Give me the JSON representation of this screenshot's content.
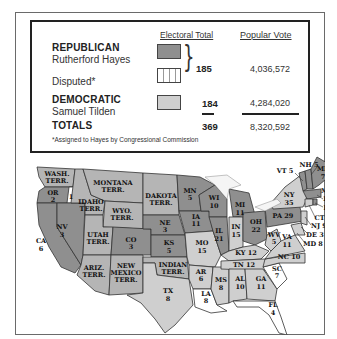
{
  "legend": {
    "headers": {
      "electoral_total": "Electoral Total",
      "popular_vote": "Popular Vote"
    },
    "republican": {
      "party": "REPUBLICAN",
      "candidate": "Rutherford Hayes",
      "color": "#8f8f8f"
    },
    "disputed": {
      "label": "Disputed*",
      "pattern": "vertical-stripes"
    },
    "combined_electoral": "185",
    "republican_popular": "4,036,572",
    "democratic": {
      "party": "DEMOCRATIC",
      "candidate": "Samuel Tilden",
      "color": "#cfcfcf",
      "electoral": "184",
      "popular": "4,284,020"
    },
    "totals": {
      "label": "TOTALS",
      "electoral": "369",
      "popular": "8,320,592"
    },
    "footnote": "*Assigned to Hayes by Congressional Commission"
  },
  "map": {
    "title": "1876 Presidential Election Electoral Map",
    "colors": {
      "republican": "#8f8f8f",
      "democratic": "#cfcfcf",
      "disputed": "#ffffff",
      "territory": "#b5b5b5",
      "border": "#333333"
    },
    "regions": [
      {
        "label": "WASH. TERR.",
        "type": "territory"
      },
      {
        "label": "OR 2",
        "type": "republican",
        "note": "1 disputed"
      },
      {
        "label": "CA 6",
        "type": "republican"
      },
      {
        "label": "NV 3",
        "type": "republican"
      },
      {
        "label": "IDAHO TERR.",
        "type": "territory"
      },
      {
        "label": "MONTANA TERR.",
        "type": "territory"
      },
      {
        "label": "WYO. TERR.",
        "type": "territory"
      },
      {
        "label": "UTAH TERR.",
        "type": "territory"
      },
      {
        "label": "ARIZ. TERR.",
        "type": "territory"
      },
      {
        "label": "NEW MEXICO TERR.",
        "type": "territory"
      },
      {
        "label": "DAKOTA TERR.",
        "type": "territory"
      },
      {
        "label": "CO 3",
        "type": "republican"
      },
      {
        "label": "NE 3",
        "type": "republican"
      },
      {
        "label": "KS 5",
        "type": "republican"
      },
      {
        "label": "INDIAN TERR.",
        "type": "territory"
      },
      {
        "label": "TX 8",
        "type": "democratic"
      },
      {
        "label": "MN 5",
        "type": "republican"
      },
      {
        "label": "IA 11",
        "type": "republican"
      },
      {
        "label": "MO 15",
        "type": "democratic"
      },
      {
        "label": "AR 6",
        "type": "democratic"
      },
      {
        "label": "LA 8",
        "type": "disputed"
      },
      {
        "label": "WI 10",
        "type": "republican"
      },
      {
        "label": "IL 21",
        "type": "republican"
      },
      {
        "label": "MS 8",
        "type": "democratic"
      },
      {
        "label": "MI 11",
        "type": "republican"
      },
      {
        "label": "IN 15",
        "type": "democratic"
      },
      {
        "label": "KY 12",
        "type": "democratic"
      },
      {
        "label": "TN 12",
        "type": "democratic"
      },
      {
        "label": "AL 10",
        "type": "democratic"
      },
      {
        "label": "GA 11",
        "type": "democratic"
      },
      {
        "label": "FL 4",
        "type": "disputed"
      },
      {
        "label": "OH 22",
        "type": "republican"
      },
      {
        "label": "WV 5",
        "type": "democratic"
      },
      {
        "label": "VA 11",
        "type": "democratic"
      },
      {
        "label": "NC 10",
        "type": "democratic"
      },
      {
        "label": "SC 7",
        "type": "disputed"
      },
      {
        "label": "PA 29",
        "type": "republican"
      },
      {
        "label": "NY 35",
        "type": "democratic"
      },
      {
        "label": "VT 5",
        "type": "republican"
      },
      {
        "label": "NH 5",
        "type": "republican"
      },
      {
        "label": "ME 7",
        "type": "republican"
      },
      {
        "label": "MA 13",
        "type": "republican"
      },
      {
        "label": "RI 4",
        "type": "republican"
      },
      {
        "label": "CT 6",
        "type": "democratic"
      },
      {
        "label": "NJ 9",
        "type": "democratic"
      },
      {
        "label": "DE 3",
        "type": "democratic"
      },
      {
        "label": "MD 8",
        "type": "democratic"
      }
    ],
    "labels": {
      "wash": [
        "WASH.",
        "TERR."
      ],
      "or": [
        "OR",
        "2"
      ],
      "or_disputed": "1",
      "ca": [
        "CA",
        "6"
      ],
      "nv": [
        "NV",
        "3"
      ],
      "idaho": [
        "IDAHO",
        "TERR."
      ],
      "montana": [
        "MONTANA",
        "TERR."
      ],
      "wyo": [
        "WYO.",
        "TERR."
      ],
      "utah": [
        "UTAH",
        "TERR."
      ],
      "ariz": [
        "ARIZ.",
        "TERR."
      ],
      "nm": [
        "NEW",
        "MEXICO",
        "TERR."
      ],
      "dakota": [
        "DAKOTA",
        "TERR."
      ],
      "co": [
        "CO",
        "3"
      ],
      "ne": [
        "NE",
        "3"
      ],
      "ks": [
        "KS",
        "5"
      ],
      "indian": [
        "INDIAN",
        "TERR."
      ],
      "tx": [
        "TX",
        "8"
      ],
      "mn": [
        "MN",
        "5"
      ],
      "ia": [
        "IA",
        "11"
      ],
      "mo": [
        "MO",
        "15"
      ],
      "ar": [
        "AR",
        "6"
      ],
      "la": [
        "LA",
        "8"
      ],
      "wi": [
        "WI",
        "10"
      ],
      "il": [
        "IL",
        "21"
      ],
      "ms": [
        "MS",
        "8"
      ],
      "mi": [
        "MI",
        "11"
      ],
      "in": [
        "IN",
        "15"
      ],
      "ky": "KY 12",
      "tn": "TN 12",
      "al": [
        "AL",
        "10"
      ],
      "ga": [
        "GA",
        "11"
      ],
      "fl": [
        "FL",
        "4"
      ],
      "oh": [
        "OH",
        "22"
      ],
      "wv": [
        "WV",
        "5"
      ],
      "va": [
        "VA",
        "11"
      ],
      "nc": "NC 10",
      "sc": [
        "SC",
        "7"
      ],
      "pa": "PA 29",
      "ny": [
        "NY",
        "35"
      ],
      "vt": "VT 5",
      "nh": "NH 5",
      "me": [
        "ME",
        "7"
      ],
      "ma": [
        "MA",
        "13"
      ],
      "ri": "RI 4",
      "ct": "CT 6",
      "nj": "NJ 9",
      "de": "DE 3",
      "md": "MD 8"
    }
  }
}
